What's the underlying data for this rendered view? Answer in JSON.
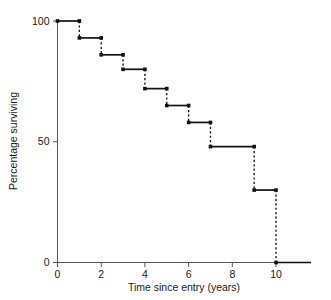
{
  "chart_data": {
    "type": "line",
    "subtype": "kaplan-meier-step",
    "title": "",
    "xlabel": "Time since entry (years)",
    "ylabel": "Percentage surviving",
    "xlim": [
      0,
      11.6
    ],
    "ylim": [
      0,
      100
    ],
    "xticks": [
      0,
      2,
      4,
      6,
      8,
      10
    ],
    "xtick_labels": [
      "0",
      "2",
      "4",
      "6",
      "8",
      "10"
    ],
    "yticks": [
      0,
      50,
      100
    ],
    "ytick_labels": [
      "0",
      "50",
      "100"
    ],
    "grid": false,
    "legend": null,
    "marker": "filled-square-dot",
    "drop_line_style": "dashed",
    "step_line_style": "solid",
    "series_color": "#111111",
    "axis_color": "#555555",
    "x": [
      0,
      1,
      2,
      3,
      4,
      5,
      6,
      7,
      9,
      10,
      11.6
    ],
    "y": [
      100,
      93,
      86,
      80,
      72,
      65,
      58,
      48,
      30,
      0,
      0
    ],
    "steps": [
      {
        "t_start": 0,
        "t_end": 1,
        "value": 100
      },
      {
        "t_start": 1,
        "t_end": 2,
        "value": 93
      },
      {
        "t_start": 2,
        "t_end": 3,
        "value": 86
      },
      {
        "t_start": 3,
        "t_end": 4,
        "value": 80
      },
      {
        "t_start": 4,
        "t_end": 5,
        "value": 72
      },
      {
        "t_start": 5,
        "t_end": 6,
        "value": 65
      },
      {
        "t_start": 6,
        "t_end": 7,
        "value": 58
      },
      {
        "t_start": 7,
        "t_end": 9,
        "value": 48
      },
      {
        "t_start": 9,
        "t_end": 10,
        "value": 30
      },
      {
        "t_start": 10,
        "t_end": 11.6,
        "value": 0
      }
    ],
    "event_times": [
      1,
      2,
      3,
      4,
      5,
      6,
      7,
      9,
      10
    ],
    "values_after_event": [
      93,
      86,
      80,
      72,
      65,
      58,
      48,
      30,
      0
    ]
  }
}
